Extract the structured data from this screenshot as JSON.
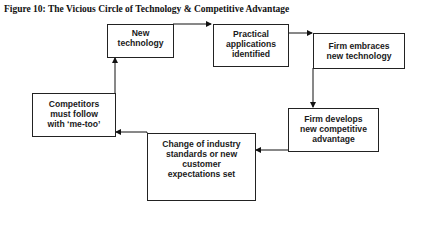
{
  "figure": {
    "title": "Figure 10: The Vicious Circle of Technology & Competitive Advantage"
  },
  "nodes": [
    {
      "id": "new-technology",
      "label": "New\ntechnology"
    },
    {
      "id": "practical-applications",
      "label": "Practical\napplications\nidentified"
    },
    {
      "id": "firm-embraces",
      "label": "Firm embraces\nnew technology"
    },
    {
      "id": "firm-develops",
      "label": "Firm develops\nnew competitive\nadvantage"
    },
    {
      "id": "change-standards",
      "label": "Change of industry\nstandards or new\ncustomer\nexpectations set"
    },
    {
      "id": "competitors-follow",
      "label": "Competitors\nmust follow\nwith ‘me-too’"
    }
  ],
  "edges": [
    {
      "from": "new-technology",
      "to": "practical-applications"
    },
    {
      "from": "practical-applications",
      "to": "firm-embraces"
    },
    {
      "from": "firm-embraces",
      "to": "firm-develops"
    },
    {
      "from": "firm-develops",
      "to": "change-standards"
    },
    {
      "from": "change-standards",
      "to": "competitors-follow"
    },
    {
      "from": "competitors-follow",
      "to": "new-technology"
    }
  ]
}
